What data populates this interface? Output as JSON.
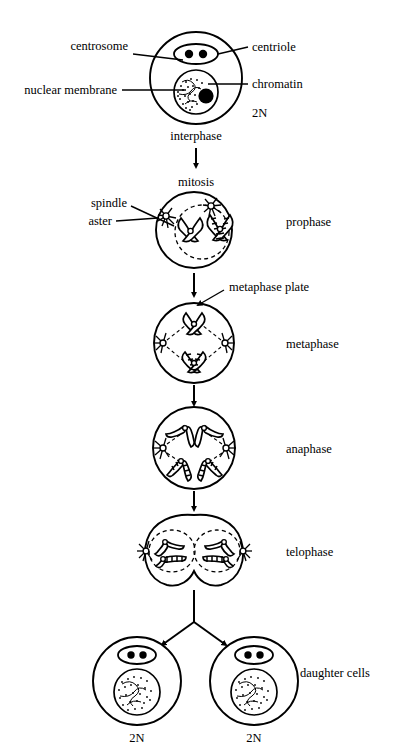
{
  "diagram": {
    "title": "Mitosis",
    "ink_color": "#000000",
    "background_color": "#ffffff"
  },
  "callouts": {
    "centrosome": "centrosome",
    "centriole": "centriole",
    "nuclear_membrane": "nuclear membrane",
    "chromatin": "chromatin",
    "spindle": "spindle",
    "aster": "aster",
    "metaphase_plate": "metaphase plate"
  },
  "process_label": "mitosis",
  "stages": [
    {
      "id": "interphase",
      "label": "interphase",
      "label_position": "below",
      "ploidy": "2N"
    },
    {
      "id": "prophase",
      "label": "prophase",
      "label_position": "right"
    },
    {
      "id": "metaphase",
      "label": "metaphase",
      "label_position": "right"
    },
    {
      "id": "anaphase",
      "label": "anaphase",
      "label_position": "right"
    },
    {
      "id": "telophase",
      "label": "telophase",
      "label_position": "right"
    },
    {
      "id": "daughter-cells",
      "label": "daughter cells",
      "label_position": "right"
    }
  ],
  "daughter_cells": {
    "label": "daughter cells",
    "left_ploidy": "2N",
    "right_ploidy": "2N"
  }
}
